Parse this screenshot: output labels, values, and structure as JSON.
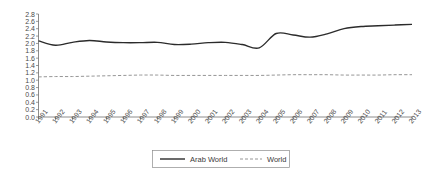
{
  "chart_data": {
    "type": "line",
    "title": "",
    "xlabel": "",
    "ylabel": "",
    "ylim": [
      0.0,
      2.8
    ],
    "ytick_step": 0.2,
    "grid": false,
    "legend_position": "bottom-center",
    "categories": [
      "1991",
      "1992",
      "1993",
      "1994",
      "1995",
      "1996",
      "1997",
      "1998",
      "1999",
      "2000",
      "2001",
      "2002",
      "2003",
      "2004",
      "2005",
      "2006",
      "2007",
      "2008",
      "2009",
      "2010",
      "2011",
      "2012",
      "2013"
    ],
    "yticks": [
      "0.0",
      "0.2",
      "0.4",
      "0.6",
      "0.8",
      "1.0",
      "1.2",
      "1.4",
      "1.6",
      "1.8",
      "2.0",
      "2.2",
      "2.4",
      "2.6",
      "2.8"
    ],
    "series": [
      {
        "name": "Arab World",
        "style": "solid",
        "color": "#2b2b2b",
        "values": [
          2.07,
          1.95,
          2.03,
          2.08,
          2.04,
          2.02,
          2.02,
          2.03,
          1.97,
          1.98,
          2.02,
          2.03,
          1.97,
          1.88,
          2.27,
          2.23,
          2.17,
          2.26,
          2.4,
          2.46,
          2.48,
          2.5,
          2.52
        ]
      },
      {
        "name": "World",
        "style": "dashed",
        "color": "#8a8a8a",
        "values": [
          1.09,
          1.1,
          1.1,
          1.11,
          1.12,
          1.13,
          1.14,
          1.14,
          1.13,
          1.13,
          1.13,
          1.13,
          1.13,
          1.13,
          1.14,
          1.15,
          1.15,
          1.15,
          1.14,
          1.14,
          1.14,
          1.15,
          1.15
        ]
      }
    ]
  },
  "legend": {
    "items": [
      {
        "label": "Arab World",
        "style": "solid"
      },
      {
        "label": "World",
        "style": "dashed"
      }
    ]
  }
}
